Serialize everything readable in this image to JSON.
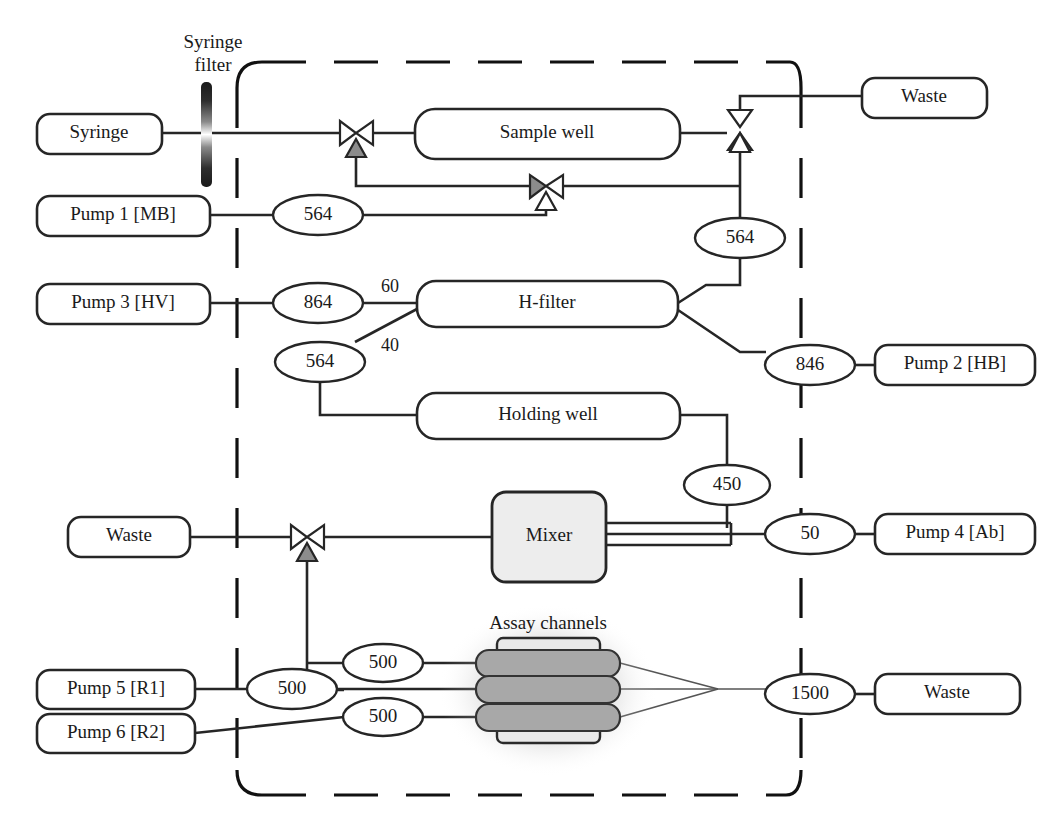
{
  "diagram": {
    "annotations": {
      "syringe_filter": "Syringe\nfilter",
      "syringe_filter_line1": "Syringe",
      "syringe_filter_line2": "filter",
      "assay_channels": "Assay channels",
      "split_60": "60",
      "split_40": "40"
    },
    "boxes": [
      {
        "id": "syringe",
        "label": "Syringe"
      },
      {
        "id": "pump1",
        "label": "Pump 1 [MB]"
      },
      {
        "id": "pump3",
        "label": "Pump 3 [HV]"
      },
      {
        "id": "sample_well",
        "label": "Sample well"
      },
      {
        "id": "h_filter",
        "label": "H-filter"
      },
      {
        "id": "holding_well",
        "label": "Holding well"
      },
      {
        "id": "waste_top",
        "label": "Waste"
      },
      {
        "id": "pump2",
        "label": "Pump 2 [HB]"
      },
      {
        "id": "waste_mid",
        "label": "Waste"
      },
      {
        "id": "mixer",
        "label": "Mixer"
      },
      {
        "id": "pump4",
        "label": "Pump 4 [Ab]"
      },
      {
        "id": "pump5",
        "label": "Pump 5 [R1]"
      },
      {
        "id": "pump6",
        "label": "Pump 6 [R2]"
      },
      {
        "id": "waste_bot",
        "label": "Waste"
      }
    ],
    "volumes": [
      {
        "id": "v-pump1",
        "value": "564"
      },
      {
        "id": "v-right",
        "value": "564"
      },
      {
        "id": "v-pump3",
        "value": "864"
      },
      {
        "id": "v-hfilter",
        "value": "564"
      },
      {
        "id": "v-pump2",
        "value": "846"
      },
      {
        "id": "v-holding",
        "value": "450"
      },
      {
        "id": "v-pump4",
        "value": "50"
      },
      {
        "id": "v-r1",
        "value": "500"
      },
      {
        "id": "v-assay-a",
        "value": "500"
      },
      {
        "id": "v-assay-c",
        "value": "500"
      },
      {
        "id": "v-waste",
        "value": "1500"
      }
    ],
    "valves": [
      {
        "id": "valve-sample-in",
        "orientation": "horizontal"
      },
      {
        "id": "valve-sample-out",
        "orientation": "vertical"
      },
      {
        "id": "valve-mb-line",
        "orientation": "horizontal"
      },
      {
        "id": "valve-waste-mid",
        "orientation": "horizontal"
      }
    ],
    "colors": {
      "line": "#262626",
      "valve_actuator": "#8c8c8c",
      "assay_channel": "#a8a8a8",
      "mixer_fill": "#ededed",
      "background": "#ffffff"
    }
  }
}
